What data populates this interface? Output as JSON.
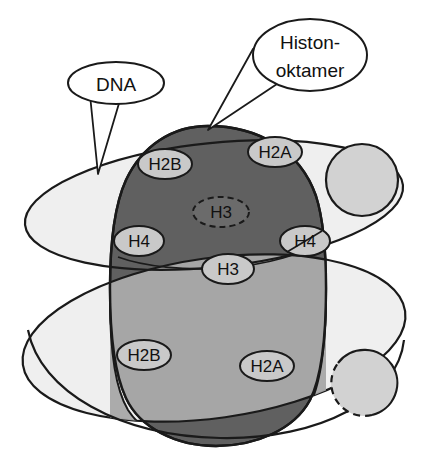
{
  "figure": {
    "background_color": "#ffffff"
  },
  "palette": {
    "octamer_dark": "#606060",
    "octamer_mid": "#a6a6a6",
    "dna_light": "#efefef",
    "dna_overlap": "#dcdcdc",
    "label_fill": "#c9c9c9",
    "globule_fill": "#d2d2d2",
    "outline": "#1a1a1a",
    "text": "#111111",
    "callout_fill": "#ffffff"
  },
  "callouts": [
    {
      "id": "dna-callout",
      "label": "DNA",
      "lines": [
        "DNA"
      ],
      "bubble": {
        "cx": 116,
        "cy": 83,
        "rx": 48,
        "ry": 21
      },
      "tail_target": {
        "x": 98,
        "y": 172
      }
    },
    {
      "id": "histone-oktamer-callout",
      "label": "Histon-oktamer",
      "lines": [
        "Histon-",
        "oktamer"
      ],
      "bubble": {
        "cx": 310,
        "cy": 55,
        "rx": 57,
        "ry": 36
      },
      "tail_target": {
        "x": 208,
        "y": 129
      }
    }
  ],
  "histone_labels": [
    {
      "id": "h2b-top",
      "text": "H2B",
      "cx": 165,
      "cy": 164,
      "rx": 27,
      "ry": 15,
      "border": "solid"
    },
    {
      "id": "h2a-top",
      "text": "H2A",
      "cx": 275,
      "cy": 152,
      "rx": 27,
      "ry": 15,
      "border": "solid"
    },
    {
      "id": "h3-upper",
      "text": "H3",
      "cx": 221,
      "cy": 212,
      "rx": 28,
      "ry": 15,
      "border": "dashed"
    },
    {
      "id": "h4-left",
      "text": "H4",
      "cx": 139,
      "cy": 241,
      "rx": 25,
      "ry": 15,
      "border": "solid"
    },
    {
      "id": "h4-right",
      "text": "H4",
      "cx": 305,
      "cy": 241,
      "rx": 25,
      "ry": 15,
      "border": "solid"
    },
    {
      "id": "h3-lower",
      "text": "H3",
      "cx": 228,
      "cy": 269,
      "rx": 26,
      "ry": 15,
      "border": "solid"
    },
    {
      "id": "h2b-bottom",
      "text": "H2B",
      "cx": 144,
      "cy": 355,
      "rx": 27,
      "ry": 15,
      "border": "solid"
    },
    {
      "id": "h2a-bottom",
      "text": "H2A",
      "cx": 267,
      "cy": 366,
      "rx": 27,
      "ry": 15,
      "border": "solid"
    }
  ],
  "globules": [
    {
      "id": "globule-upper-right",
      "cx": 362,
      "cy": 180,
      "r": 36,
      "outline": "solid"
    },
    {
      "id": "globule-lower-right",
      "cx": 364,
      "cy": 383,
      "r": 33,
      "outline": "mixed-dashed"
    }
  ],
  "dna_strands": [
    {
      "id": "dna-upper-coil",
      "description": "upper DNA gyre ellipse, tilted"
    },
    {
      "id": "dna-lower-coil",
      "description": "lower DNA gyre ellipse, tilted with tail to lower right"
    }
  ],
  "octamer": {
    "id": "histone-octamer-body",
    "description": "barrel shaped histone octamer core"
  }
}
